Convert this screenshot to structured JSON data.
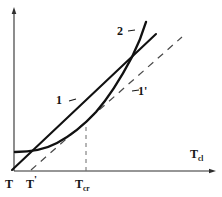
{
  "figure": {
    "type": "diagram",
    "background_color": "#ffffff",
    "ink_color": "#141414"
  },
  "axes": {
    "x_axis": {
      "label_text": "T",
      "label_subscript": "cl",
      "arrow": true,
      "name": "x-axis-Tcl"
    },
    "y_axis": {
      "label_text": "",
      "arrow": true,
      "name": "y-axis"
    }
  },
  "ticks": [
    {
      "id": "T",
      "base": "T",
      "subscript": "",
      "prime": "",
      "x": 10
    },
    {
      "id": "Tp",
      "base": "T",
      "subscript": "",
      "prime": "'",
      "x": 26
    },
    {
      "id": "Tcr",
      "base": "T",
      "subscript": "cr",
      "prime": "",
      "x": 75
    }
  ],
  "curves": [
    {
      "id": "curve-1",
      "label": "1",
      "leader": "~",
      "style": "solid",
      "weight": "thick",
      "note": "straight line rising from origin T"
    },
    {
      "id": "curve-2",
      "label": "2",
      "leader": "~",
      "style": "solid",
      "weight": "thick",
      "note": "curved trace flat at left then steeply rising"
    },
    {
      "id": "curve-1-prime",
      "label": "1'",
      "leader": "~",
      "style": "dashed",
      "weight": "thin",
      "note": "dashed asymptote line parallel to the upper part of curve 2"
    }
  ],
  "guides": [
    {
      "id": "vertical-dashed-Tcr",
      "style": "dashed",
      "note": "vertical dashed drop line from curve 2 down to the x axis at T_cr"
    }
  ]
}
